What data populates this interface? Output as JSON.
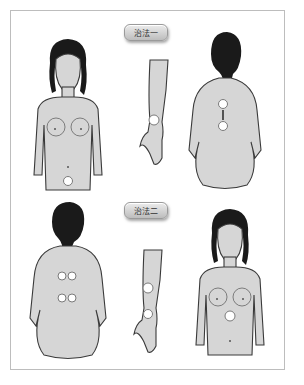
{
  "sections": [
    {
      "label": "治法一",
      "figures": [
        "front-torso",
        "forearm",
        "back-torso"
      ],
      "points": {
        "front-torso": 1,
        "forearm": 1,
        "back-torso": 2
      }
    },
    {
      "label": "治法二",
      "figures": [
        "back-torso",
        "forearm",
        "front-torso"
      ],
      "points": {
        "back-torso": 4,
        "forearm": 2,
        "front-torso": 1
      }
    }
  ],
  "colors": {
    "skin": "#d6d6d6",
    "hair": "#1a1a1a",
    "point": "#ffffff",
    "frame": "#bdbdbd"
  }
}
